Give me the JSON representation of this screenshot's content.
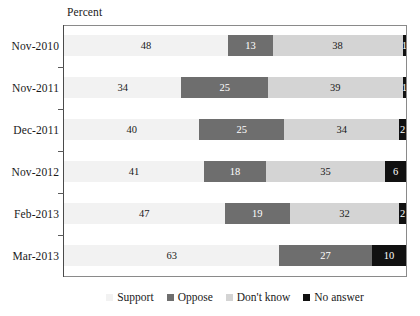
{
  "axis_caption": "Percent",
  "legend": {
    "items": [
      {
        "label": "Support",
        "color": "#f2f2f2",
        "key": "support"
      },
      {
        "label": "Oppose",
        "color": "#6e6e6e",
        "key": "oppose"
      },
      {
        "label": "Don't know",
        "color": "#d4d4d4",
        "key": "dontknow"
      },
      {
        "label": "No answer",
        "color": "#111111",
        "key": "noanswer"
      }
    ]
  },
  "chart_data": {
    "type": "bar",
    "orientation": "horizontal",
    "stacked": true,
    "normalized": true,
    "title": "",
    "subtitle": "",
    "xlabel": "Percent",
    "ylabel": "",
    "xlim": [
      0,
      100
    ],
    "grid": false,
    "legend_position": "bottom",
    "categories": [
      "Nov-2010",
      "Nov-2011",
      "Dec-2011",
      "Nov-2012",
      "Feb-2013",
      "Mar-2013"
    ],
    "series": [
      {
        "name": "Support",
        "color": "#f2f2f2",
        "values": [
          48,
          34,
          40,
          41,
          47,
          63
        ]
      },
      {
        "name": "Oppose",
        "color": "#6e6e6e",
        "values": [
          13,
          25,
          25,
          18,
          19,
          27
        ]
      },
      {
        "name": "Don't know",
        "color": "#d4d4d4",
        "values": [
          38,
          39,
          34,
          35,
          32,
          0
        ]
      },
      {
        "name": "No answer",
        "color": "#111111",
        "values": [
          1,
          1,
          2,
          6,
          2,
          10
        ]
      }
    ],
    "rows": [
      {
        "category": "Nov-2010",
        "segments": [
          {
            "series": "Support",
            "value": 48,
            "label": "48"
          },
          {
            "series": "Oppose",
            "value": 13,
            "label": "13"
          },
          {
            "series": "Don't know",
            "value": 38,
            "label": "38"
          },
          {
            "series": "No answer",
            "value": 1,
            "label": "1"
          }
        ]
      },
      {
        "category": "Nov-2011",
        "segments": [
          {
            "series": "Support",
            "value": 34,
            "label": "34"
          },
          {
            "series": "Oppose",
            "value": 25,
            "label": "25"
          },
          {
            "series": "Don't know",
            "value": 39,
            "label": "39"
          },
          {
            "series": "No answer",
            "value": 1,
            "label": "1"
          }
        ]
      },
      {
        "category": "Dec-2011",
        "segments": [
          {
            "series": "Support",
            "value": 40,
            "label": "40"
          },
          {
            "series": "Oppose",
            "value": 25,
            "label": "25"
          },
          {
            "series": "Don't know",
            "value": 34,
            "label": "34"
          },
          {
            "series": "No answer",
            "value": 2,
            "label": "2"
          }
        ]
      },
      {
        "category": "Nov-2012",
        "segments": [
          {
            "series": "Support",
            "value": 41,
            "label": "41"
          },
          {
            "series": "Oppose",
            "value": 18,
            "label": "18"
          },
          {
            "series": "Don't know",
            "value": 35,
            "label": "35"
          },
          {
            "series": "No answer",
            "value": 6,
            "label": "6"
          }
        ]
      },
      {
        "category": "Feb-2013",
        "segments": [
          {
            "series": "Support",
            "value": 47,
            "label": "47"
          },
          {
            "series": "Oppose",
            "value": 19,
            "label": "19"
          },
          {
            "series": "Don't know",
            "value": 32,
            "label": "32"
          },
          {
            "series": "No answer",
            "value": 2,
            "label": "2"
          }
        ]
      },
      {
        "category": "Mar-2013",
        "segments": [
          {
            "series": "Support",
            "value": 63,
            "label": "63"
          },
          {
            "series": "Oppose",
            "value": 27,
            "label": "27"
          },
          {
            "series": "Don't know",
            "value": 0,
            "label": ""
          },
          {
            "series": "No answer",
            "value": 10,
            "label": "10"
          }
        ]
      }
    ]
  }
}
